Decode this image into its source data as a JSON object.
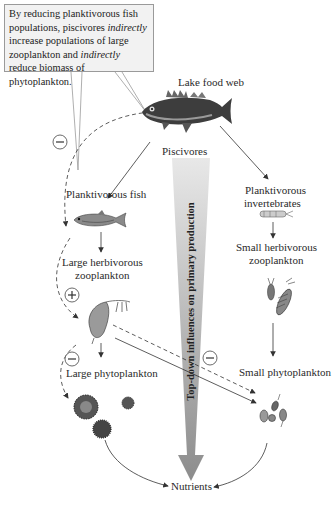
{
  "callout": {
    "segments": [
      {
        "text": "By reducing planktivorous fish populations, piscivores ",
        "italic": false
      },
      {
        "text": "indirectly",
        "italic": true
      },
      {
        "text": " increase populations of large zooplankton and ",
        "italic": false
      },
      {
        "text": "indirectly",
        "italic": true
      },
      {
        "text": " reduce biomass of phytoplankton.",
        "italic": false
      }
    ]
  },
  "labels": {
    "title": "Lake food web",
    "piscivores": "Piscivores",
    "planktivorous_fish": "Planktivorous fish",
    "large_herbivorous_zooplankton_line1": "Large herbivorous",
    "large_herbivorous_zooplankton_line2": "zooplankton",
    "large_phytoplankton": "Large phytoplankton",
    "planktivorous_invertebrates_line1": "Planktivorous",
    "planktivorous_invertebrates_line2": "invertebrates",
    "small_herbivorous_zooplankton_line1": "Small herbivorous",
    "small_herbivorous_zooplankton_line2": "zooplankton",
    "small_phytoplankton": "Small phytoplankton",
    "nutrients": "Nutrients",
    "top_down_arrow": "Top-down influences on primary production"
  },
  "signs": {
    "piscivore_effect": "−",
    "zooplankton_effect": "+",
    "large_phyto_effect": "−",
    "small_phyto_effect": "−"
  },
  "colors": {
    "callout_bg": "#f2f2f2",
    "callout_border": "#9a9a9a",
    "arrow_gradient_top": "#e6e6e6",
    "arrow_gradient_bottom": "#8f8f8f",
    "line": "#333333"
  }
}
